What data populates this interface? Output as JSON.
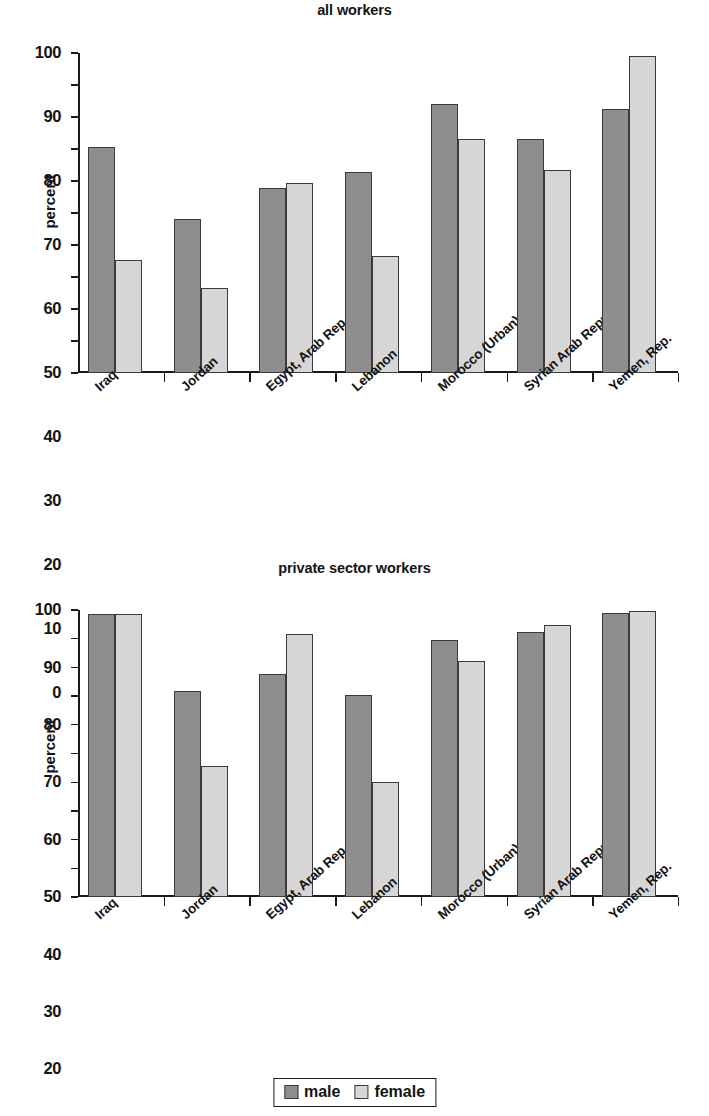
{
  "legend": {
    "male_label": "male",
    "female_label": "female",
    "male_color": "#8e8e8e",
    "female_color": "#d6d6d6"
  },
  "charts": [
    {
      "title": "all workers",
      "ylabel": "percent"
    },
    {
      "title": "private sector workers",
      "ylabel": "percent"
    }
  ],
  "chart_data": [
    {
      "type": "bar",
      "title": "all workers",
      "xlabel": "",
      "ylabel": "percent",
      "ylim": [
        0,
        100
      ],
      "yticks": [
        0,
        10,
        20,
        30,
        40,
        50,
        60,
        70,
        80,
        90,
        100
      ],
      "grid": false,
      "legend_position": "bottom",
      "categories": [
        "Iraq",
        "Jordan",
        "Egypt, Arab Rep.",
        "Lebanon",
        "Morocco (Urban)",
        "Syrian Arab Republic",
        "Yemen, Rep."
      ],
      "series": [
        {
          "name": "male",
          "values": [
            70.5,
            48.0,
            57.8,
            62.8,
            84.0,
            73.0,
            82.5
          ]
        },
        {
          "name": "female",
          "values": [
            35.3,
            26.5,
            59.3,
            36.5,
            73.0,
            63.3,
            99.0
          ]
        }
      ]
    },
    {
      "type": "bar",
      "title": "private sector workers",
      "xlabel": "",
      "ylabel": "percent",
      "ylim": [
        0,
        100
      ],
      "yticks": [
        0,
        10,
        20,
        30,
        40,
        50,
        60,
        70,
        80,
        90,
        100
      ],
      "grid": false,
      "legend_position": "bottom",
      "categories": [
        "Iraq",
        "Jordan",
        "Egypt, Arab Rep.",
        "Lebanon",
        "Morocco (Urban)",
        "Syrian Arab Republic",
        "Yemen, Rep."
      ],
      "series": [
        {
          "name": "male",
          "values": [
            98.6,
            71.8,
            77.7,
            70.3,
            89.6,
            92.4,
            98.8
          ]
        },
        {
          "name": "female",
          "values": [
            98.6,
            45.5,
            91.5,
            40.2,
            82.3,
            94.7,
            99.7
          ]
        }
      ]
    }
  ]
}
